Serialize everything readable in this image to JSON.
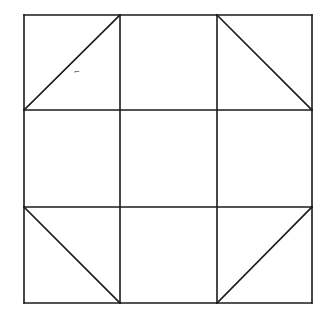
{
  "diagram": {
    "type": "quilt-block-grid",
    "stroke_color": "#1a1a1a",
    "background": "#ffffff",
    "grid": {
      "x": [
        24,
        120,
        217,
        312
      ],
      "y": [
        15,
        110,
        207,
        303
      ]
    },
    "diagonals": [
      {
        "cell": "top-left",
        "x1": 24,
        "y1": 110,
        "x2": 120,
        "y2": 15
      },
      {
        "cell": "top-right",
        "x1": 217,
        "y1": 15,
        "x2": 312,
        "y2": 110
      },
      {
        "cell": "bottom-left",
        "x1": 24,
        "y1": 207,
        "x2": 120,
        "y2": 303
      },
      {
        "cell": "bottom-right",
        "x1": 217,
        "y1": 303,
        "x2": 312,
        "y2": 207
      }
    ],
    "stray_mark": {
      "x": 74,
      "y": 74,
      "text": "⌐"
    }
  }
}
